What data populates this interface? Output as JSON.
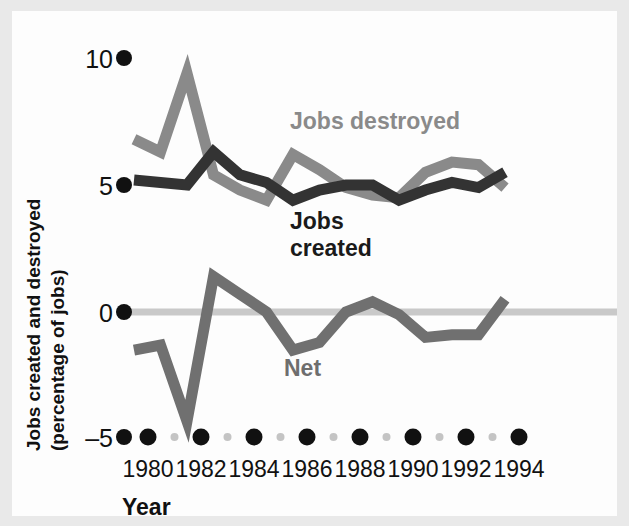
{
  "chart_data": {
    "type": "line",
    "title": "",
    "xlabel": "Year",
    "ylabel": "Jobs created and destroyed (percentage of jobs)",
    "ylabel_line1": "Jobs created and destroyed",
    "ylabel_line2": "(percentage of jobs)",
    "x": [
      1979,
      1980,
      1981,
      1982,
      1983,
      1984,
      1985,
      1986,
      1987,
      1988,
      1989,
      1990,
      1991,
      1992,
      1993
    ],
    "xlim": [
      1979,
      1994
    ],
    "ylim": [
      -5,
      10
    ],
    "yticks": [
      -5,
      0,
      5,
      10
    ],
    "ytick_labels": [
      "–5",
      "0",
      "5",
      "10"
    ],
    "xticks": [
      1980,
      1982,
      1984,
      1986,
      1988,
      1990,
      1992,
      1994
    ],
    "xtick_labels": [
      "1980",
      "1982",
      "1984",
      "1986",
      "1988",
      "1990",
      "1992",
      "1994"
    ],
    "grid": false,
    "zero_line": true,
    "legend": "inline-annotations",
    "series": [
      {
        "name": "Jobs destroyed",
        "color": "#8a8a8a",
        "label_x": 1986.0,
        "label_y": 7.4,
        "values": [
          6.8,
          6.3,
          9.4,
          5.4,
          4.8,
          4.4,
          6.2,
          5.6,
          4.9,
          4.6,
          4.5,
          5.5,
          5.9,
          5.8,
          4.9
        ]
      },
      {
        "name": "Jobs created",
        "color": "#333333",
        "label_x": 1985.6,
        "label_y": 3.5,
        "label_line1": "Jobs",
        "label_line2": "created",
        "values": [
          5.2,
          5.1,
          5.0,
          6.3,
          5.4,
          5.1,
          4.4,
          4.8,
          5.0,
          5.0,
          4.4,
          4.8,
          5.1,
          4.9,
          5.5
        ]
      },
      {
        "name": "Net",
        "color": "#707070",
        "label_x": 1985.4,
        "label_y": -1.9,
        "values": [
          -1.5,
          -1.3,
          -4.3,
          1.4,
          0.7,
          0.0,
          -1.5,
          -1.2,
          0.0,
          0.4,
          -0.1,
          -1.0,
          -0.9,
          -0.9,
          0.5
        ]
      }
    ],
    "colors": {
      "jobs_destroyed": "#8a8a8a",
      "jobs_created": "#333333",
      "net": "#707070",
      "zero_line": "#c9c9c9",
      "tick_major": "#111111",
      "tick_minor": "#bdbdbd",
      "paper": "#fdfdfd",
      "border": "#e9e9e9"
    }
  }
}
